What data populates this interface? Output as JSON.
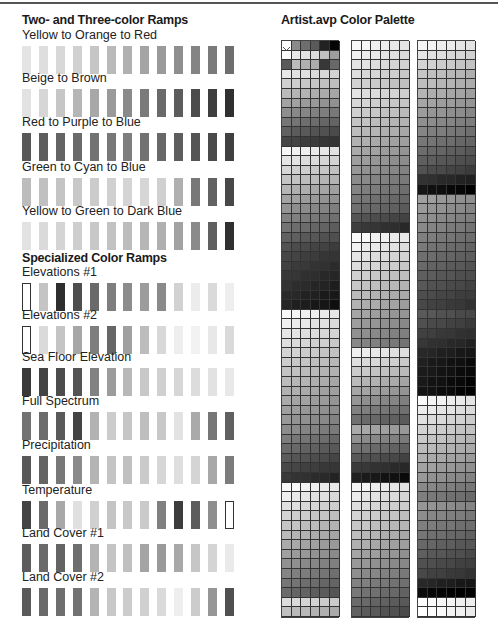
{
  "left": {
    "heading_ramps": "Two- and Three-color Ramps",
    "heading_specialized": "Specialized Color Ramps",
    "ramps": [
      {
        "label": "Yellow to Orange to Red",
        "y": 46,
        "swatches": [
          "#e4e4e4",
          "#dedede",
          "#d8d8d8",
          "#d0d0d0",
          "#c6c6c6",
          "#bababa",
          "#b0b0b0",
          "#a4a4a4",
          "#9a9a9a",
          "#8e8e8e",
          "#848484",
          "#7a7a7a",
          "#6e6e6e"
        ]
      },
      {
        "label": "Beige to Brown",
        "y": 89,
        "swatches": [
          "#e2e2e2",
          "#d6d6d6",
          "#c6c6c6",
          "#b6b6b6",
          "#a8a8a8",
          "#9a9a9a",
          "#8a8a8a",
          "#7a7a7a",
          "#6a6a6a",
          "#5c5c5c",
          "#4c4c4c",
          "#3e3e3e",
          "#303030"
        ]
      },
      {
        "label": "Red to Purple to Blue",
        "y": 133,
        "swatches": [
          "#585858",
          "#5e5e5e",
          "#646464",
          "#6a6a6a",
          "#727272",
          "#787878",
          "#7e7e7e",
          "#727272",
          "#686868",
          "#5e5e5e",
          "#545454",
          "#4a4a4a",
          "#404040"
        ]
      },
      {
        "label": "Green to Cyan to Blue",
        "y": 178,
        "swatches": [
          "#bcbcbc",
          "#c0c0c0",
          "#c4c4c4",
          "#c8c8c8",
          "#cccccc",
          "#d0d0d0",
          "#d4d4d4",
          "#d6d6d6",
          "#d0d0d0",
          "#b0b0b0",
          "#787878",
          "#626262",
          "#484848"
        ]
      },
      {
        "label": "Yellow to Green to Dark Blue",
        "y": 222,
        "swatches": [
          "#e2e2e2",
          "#dadada",
          "#d4d4d4",
          "#cecece",
          "#c8c8c8",
          "#c2c2c2",
          "#bcbcbc",
          "#b6b6b6",
          "#b0b0b0",
          "#a2a2a2",
          "#8a8a8a",
          "#606060",
          "#303030"
        ]
      },
      {
        "label": "Elevations #1",
        "y": 283,
        "swatches": [
          "outline",
          "#c4c4c4",
          "#2e2e2e",
          "#4e4e4e",
          "#6a6a6a",
          "#7e7e7e",
          "#8c8c8c",
          "#9c9c9c",
          "#8a8a8a",
          "#d2d2d2",
          "#ececec",
          "#dadada",
          "#eeeeee"
        ]
      },
      {
        "label": "Elevations #2",
        "y": 326,
        "swatches": [
          "outline",
          "#dadada",
          "#c4c4c4",
          "#a6a6a6",
          "#7e7e7e",
          "#666666",
          "#a0a0a0",
          "#bcbcbc",
          "#d8d8d8",
          "#eeeeee",
          "#f2f2f2",
          "#e8e8e8",
          "#dadada"
        ]
      },
      {
        "label": "Sea Floor Elevation",
        "y": 368,
        "swatches": [
          "#3a3a3a",
          "#444444",
          "#4c4c4c",
          "#545454",
          "#828282",
          "#9c9c9c",
          "#b8b8b8",
          "#c8c8c8",
          "#d0d0d0",
          "#d6d6d6",
          "#dcdcdc",
          "#e2e2e2",
          "#e8e8e8"
        ]
      },
      {
        "label": "Full Spectrum",
        "y": 412,
        "swatches": [
          "#727272",
          "#6c6c6c",
          "#5a5a5a",
          "#444444",
          "#b2b2b2",
          "#cccccc",
          "#c6c6c6",
          "#bebebe",
          "#c8c8c8",
          "#e2e2e2",
          "#aaaaaa",
          "#767676",
          "#606060"
        ]
      },
      {
        "label": "Precipitation",
        "y": 456,
        "swatches": [
          "#585858",
          "#646464",
          "#787878",
          "#8a8a8a",
          "#b4b4b4",
          "#c4c4c4",
          "#c0c0c0",
          "#cacaca",
          "#d6d6d6",
          "#dedede",
          "#d4d4d4",
          "#a8a8a8",
          "#7c7c7c"
        ]
      },
      {
        "label": "Temperature",
        "y": 501,
        "swatches": [
          "#444444",
          "#6a6a6a",
          "#a8a8a8",
          "#e0e0e0",
          "#d0d0d0",
          "#c4c4c4",
          "#c8c8c8",
          "#cacaca",
          "#808080",
          "#3c3c3c",
          "#5c5c5c",
          "#8e8e8e",
          "outline"
        ]
      },
      {
        "label": "Land Cover #1",
        "y": 544,
        "swatches": [
          "#5c5c5c",
          "#6a6a6a",
          "#646464",
          "#6e6e6e",
          "#b4b4b4",
          "#c4c4c4",
          "#c0c0c0",
          "#a4a4a4",
          "#9a9a9a",
          "#a8a8a8",
          "#c6c6c6",
          "#d4d4d4",
          "#eaeaea"
        ]
      },
      {
        "label": "Land Cover #2",
        "y": 588,
        "swatches": [
          "#5a5a5a",
          "#6a6a6a",
          "#6e6e6e",
          "#727272",
          "#b4b4b4",
          "#c8c8c8",
          "#cccccc",
          "#d0d0d0",
          "#dadada",
          "#eeeeee",
          "#cccccc",
          "#969696",
          "#505050"
        ]
      }
    ]
  },
  "right": {
    "heading": "Artist.avp Color Palette",
    "palette": {
      "rows": 60,
      "cols_per_block": 6,
      "first_rows": [
        [
          "x",
          "#8a8a8a",
          "#6e6e6e",
          "#5a5a5a",
          "#222222",
          "#050505"
        ],
        [
          "#ffffff",
          "#e8e8e8",
          "#e2e2e2",
          "#dcdcdc",
          "#c0c0c0",
          "#9e9e9e"
        ],
        [
          "#5a5a5a",
          "#bcbcbc",
          "#b0b0b0",
          "#acacac",
          "#383838",
          "#686868"
        ]
      ],
      "blocks": [
        {
          "x": 281,
          "bands": [
            [
              3,
              10,
              230,
              95
            ],
            [
              10,
              11,
              70,
              70
            ],
            [
              11,
              22,
              245,
              80
            ],
            [
              22,
              28,
              70,
              35
            ],
            [
              28,
              40,
              248,
              150
            ],
            [
              40,
              46,
              140,
              55
            ],
            [
              46,
              58,
              250,
              105
            ],
            [
              58,
              60,
              220,
              190
            ]
          ]
        },
        {
          "x": 351,
          "bands": [
            [
              0,
              5,
              248,
              210
            ],
            [
              5,
              17,
              225,
              120
            ],
            [
              17,
              20,
              110,
              60
            ],
            [
              20,
              32,
              250,
              135
            ],
            [
              32,
              40,
              240,
              110
            ],
            [
              40,
              46,
              170,
              30
            ],
            [
              46,
              60,
              245,
              95
            ]
          ]
        },
        {
          "x": 417,
          "bands": [
            [
              0,
              4,
              245,
              195
            ],
            [
              4,
              13,
              190,
              95
            ],
            [
              13,
              16,
              80,
              20
            ],
            [
              16,
              28,
              160,
              70
            ],
            [
              28,
              33,
              90,
              40
            ],
            [
              33,
              37,
              30,
              20
            ],
            [
              37,
              48,
              248,
              125
            ],
            [
              48,
              56,
              150,
              70
            ],
            [
              56,
              58,
              40,
              10
            ],
            [
              58,
              60,
              255,
              255
            ]
          ]
        }
      ]
    }
  }
}
